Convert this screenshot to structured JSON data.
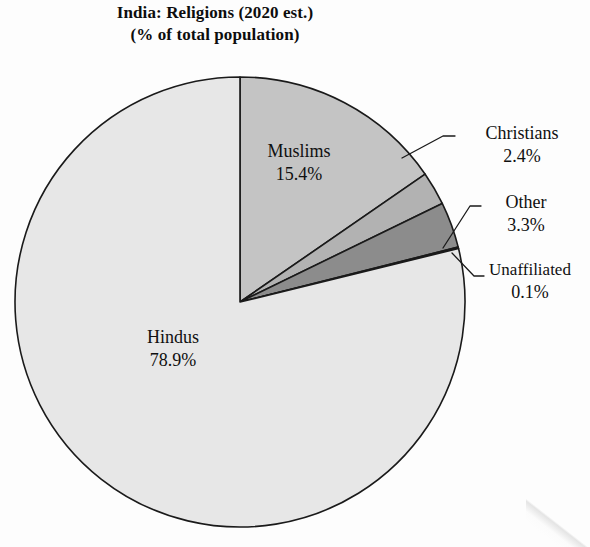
{
  "title": {
    "line1": "India: Religions (2020 est.)",
    "line2": "(% of total population)"
  },
  "chart_data": {
    "type": "pie",
    "title": "India: Religions (2020 est.) (% of total population)",
    "unit": "% of total population",
    "start_angle_deg": 0,
    "direction": "clockwise",
    "legend": "none",
    "labels_inside": [
      "Hindus",
      "Muslims"
    ],
    "labels_outside": [
      "Christians",
      "Other",
      "Unaffiliated"
    ],
    "categories": [
      "Muslims",
      "Christians",
      "Other",
      "Unaffiliated",
      "Hindus"
    ],
    "values": [
      15.4,
      2.4,
      3.3,
      0.1,
      78.9
    ],
    "slices": [
      {
        "name": "Muslims",
        "value": 15.4,
        "value_text": "15.4%",
        "color": "#c4c4c4"
      },
      {
        "name": "Christians",
        "value": 2.4,
        "value_text": "2.4%",
        "color": "#b2b2b2"
      },
      {
        "name": "Other",
        "value": 3.3,
        "value_text": "3.3%",
        "color": "#8c8c8c"
      },
      {
        "name": "Unaffiliated",
        "value": 0.1,
        "value_text": "0.1%",
        "color": "#6e6e6e"
      },
      {
        "name": "Hindus",
        "value": 78.9,
        "value_text": "78.9%",
        "color": "#e7e7e7"
      }
    ]
  },
  "labels": {
    "hindus": {
      "name": "Hindus",
      "value": "78.9%"
    },
    "muslims": {
      "name": "Muslims",
      "value": "15.4%"
    },
    "christians": {
      "name": "Christians",
      "value": "2.4%"
    },
    "other": {
      "name": "Other",
      "value": "3.3%"
    },
    "unaffiliated": {
      "name": "Unaffiliated",
      "value": "0.1%"
    }
  },
  "colors": {
    "hindus": "#e7e7e7",
    "muslims": "#c4c4c4",
    "christians": "#b2b2b2",
    "other": "#8c8c8c",
    "unaffiliated": "#6e6e6e",
    "outline": "#1a1a1a",
    "text": "#101010",
    "background": "#fdfdfd"
  }
}
